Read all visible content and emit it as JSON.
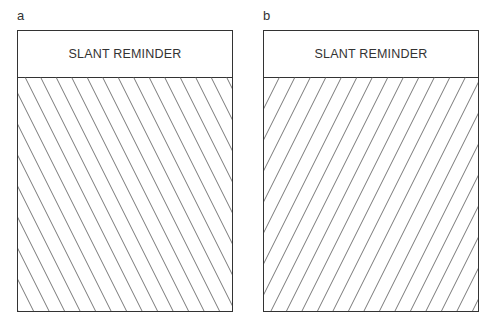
{
  "panels": [
    {
      "label": "a",
      "header": "SLANT REMINDER",
      "hatch_direction": "backslash",
      "line_color": "#555555"
    },
    {
      "label": "b",
      "header": "SLANT REMINDER",
      "hatch_direction": "forward-slash",
      "line_color": "#555555"
    }
  ]
}
